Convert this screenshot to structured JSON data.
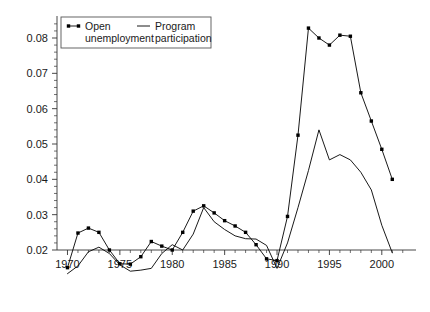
{
  "chart_data": {
    "type": "line",
    "title": "",
    "xlabel": "",
    "ylabel": "",
    "xlim": [
      1969,
      2002.5
    ],
    "ylim": [
      0.013,
      0.085
    ],
    "grid": false,
    "legend_position": "top-left",
    "y_ticks": [
      0.02,
      0.03,
      0.04,
      0.05,
      0.06,
      0.07,
      0.08
    ],
    "y_tick_labels": [
      "0.02",
      "0.03",
      "0.04",
      "0.05",
      "0.06",
      "0.07",
      "0.08"
    ],
    "y_minor_step": 0.002,
    "x_ticks": [
      1970,
      1975,
      1980,
      1985,
      1990,
      1995,
      2000
    ],
    "x_tick_labels": [
      "1970",
      "1975",
      "1980",
      "1985",
      "1990",
      "1995",
      "2000"
    ],
    "x_minor_step": 1,
    "series": [
      {
        "name": "Open unemployment",
        "marker": "square",
        "x": [
          1970,
          1971,
          1972,
          1973,
          1974,
          1975,
          1976,
          1977,
          1978,
          1979,
          1980,
          1981,
          1982,
          1983,
          1984,
          1985,
          1986,
          1987,
          1988,
          1989,
          1990,
          1991,
          1992,
          1993,
          1994,
          1995,
          1996,
          1997,
          1998,
          1999,
          2000,
          2001
        ],
        "values": [
          0.015,
          0.0248,
          0.0262,
          0.025,
          0.02,
          0.0161,
          0.016,
          0.0181,
          0.0224,
          0.0211,
          0.02,
          0.025,
          0.031,
          0.0325,
          0.0305,
          0.0283,
          0.0268,
          0.025,
          0.0215,
          0.0175,
          0.017,
          0.0295,
          0.0525,
          0.0828,
          0.08,
          0.078,
          0.0808,
          0.0805,
          0.0645,
          0.0565,
          0.0485,
          0.04
        ]
      },
      {
        "name": "Program participation",
        "marker": "none",
        "x": [
          1970,
          1971,
          1972,
          1973,
          1974,
          1975,
          1976,
          1977,
          1978,
          1979,
          1980,
          1981,
          1982,
          1983,
          1984,
          1985,
          1986,
          1987,
          1988,
          1989,
          1990,
          1991,
          1992,
          1993,
          1994,
          1995,
          1996,
          1997,
          1998,
          1999,
          2000,
          2001
        ],
        "values": [
          0.0133,
          0.0155,
          0.0195,
          0.0208,
          0.019,
          0.0158,
          0.014,
          0.0143,
          0.0148,
          0.019,
          0.0215,
          0.02,
          0.0245,
          0.032,
          0.028,
          0.0258,
          0.024,
          0.0232,
          0.0231,
          0.0213,
          0.0148,
          0.022,
          0.032,
          0.0425,
          0.054,
          0.0455,
          0.047,
          0.0455,
          0.042,
          0.037,
          0.027,
          0.0192
        ]
      }
    ]
  },
  "legend": {
    "entries": [
      {
        "label_line1": "Open",
        "label_line2": "unemployment",
        "style": "marker-line"
      },
      {
        "label_line1": "Program",
        "label_line2": "participation",
        "style": "plain-line"
      }
    ]
  },
  "colors": {
    "line": "#000000",
    "axis": "#333333",
    "text": "#1a1a1a",
    "background": "#ffffff"
  }
}
